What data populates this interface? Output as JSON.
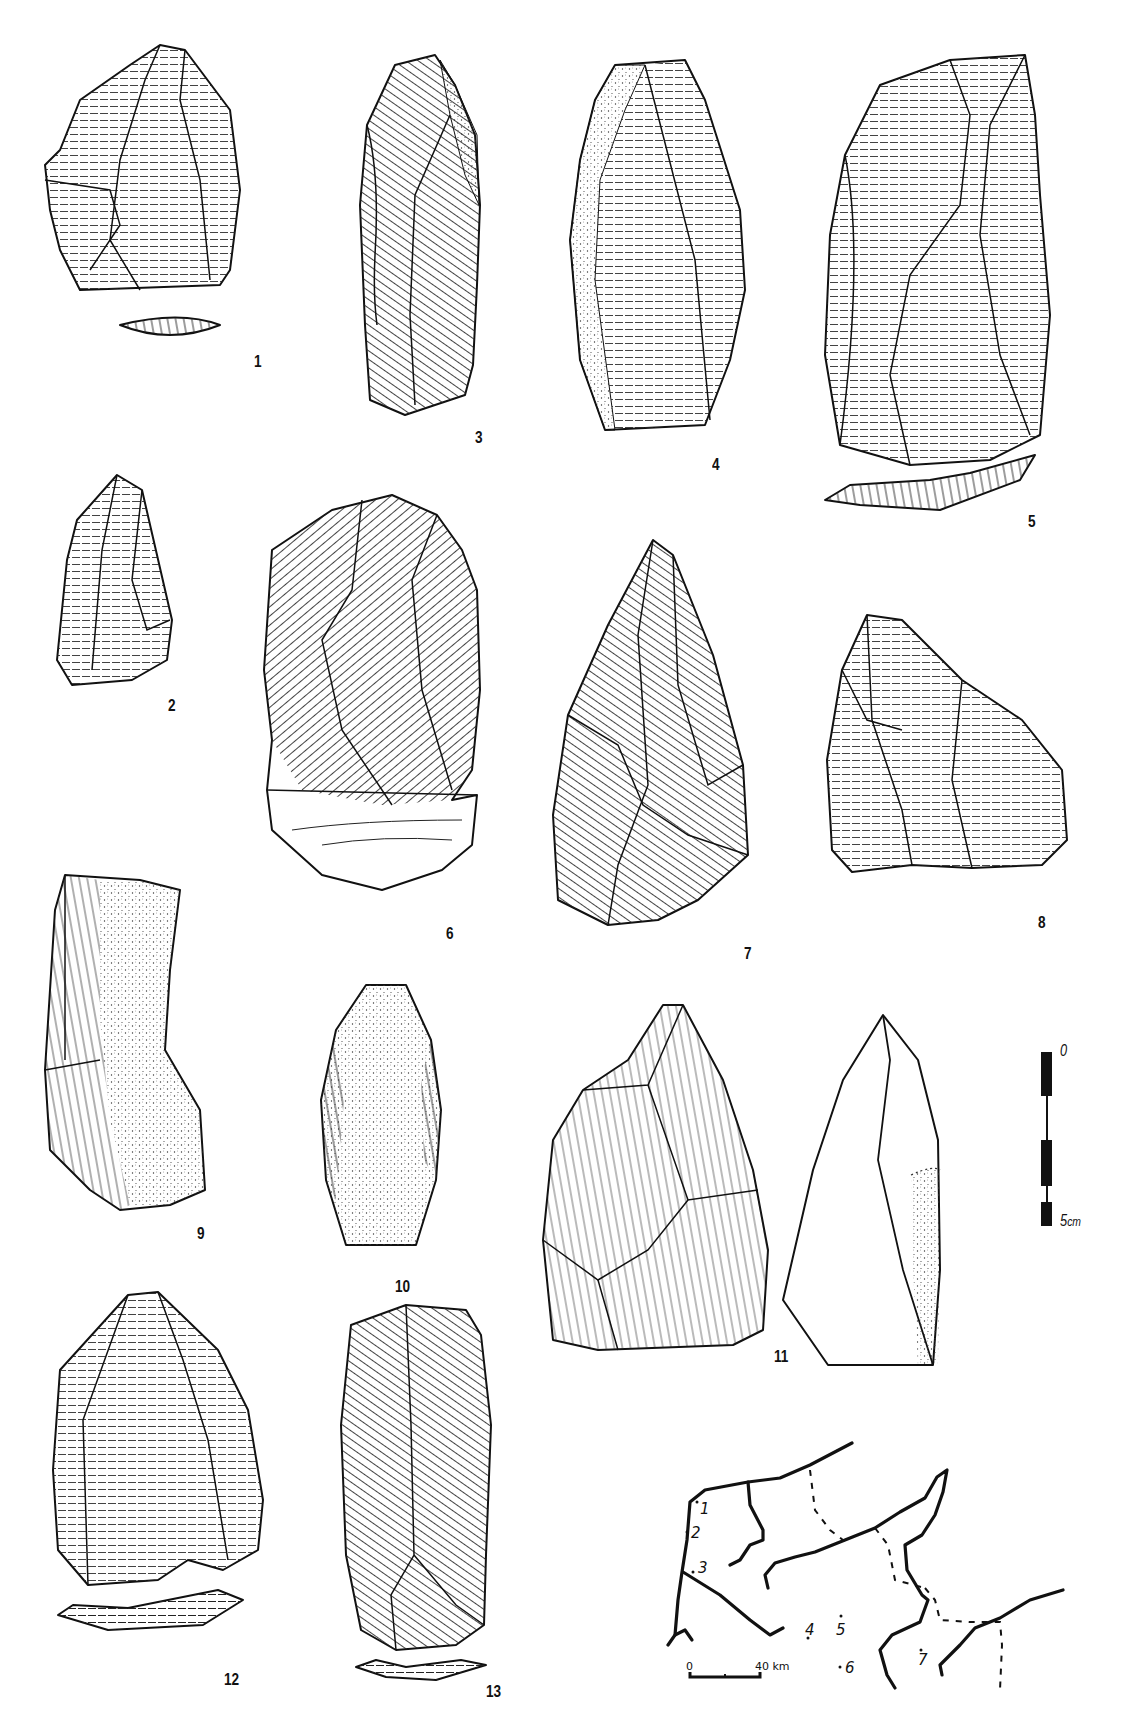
{
  "figure": {
    "artifacts": [
      {
        "id": "1",
        "label": "1",
        "has_section": true
      },
      {
        "id": "2",
        "label": "2",
        "has_section": false
      },
      {
        "id": "3",
        "label": "3",
        "has_section": false
      },
      {
        "id": "4",
        "label": "4",
        "has_section": false
      },
      {
        "id": "5",
        "label": "5",
        "has_section": true
      },
      {
        "id": "6",
        "label": "6",
        "has_section": false
      },
      {
        "id": "7",
        "label": "7",
        "has_section": false
      },
      {
        "id": "8",
        "label": "8",
        "has_section": false
      },
      {
        "id": "9",
        "label": "9",
        "has_section": false
      },
      {
        "id": "10",
        "label": "10",
        "has_section": false
      },
      {
        "id": "11",
        "label": "11",
        "has_section": true
      },
      {
        "id": "12",
        "label": "12",
        "has_section": true
      },
      {
        "id": "13",
        "label": "13",
        "has_section": true
      }
    ],
    "scale_bar": {
      "top_label": "0",
      "bottom_label": "5",
      "unit": "cm",
      "segments": 5
    },
    "map": {
      "site_labels": [
        "1",
        "2",
        "3",
        "4",
        "5",
        "6",
        "7"
      ],
      "scale": {
        "start_label": "0",
        "end_label": "40 km"
      }
    }
  }
}
